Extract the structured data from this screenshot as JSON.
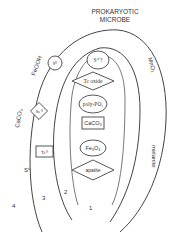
{
  "title_line1": "PROKARYOTIC",
  "title_line2": "MICROBE",
  "zone_labels": {
    "z1": "1",
    "z2": "2",
    "z3": "3",
    "z4": "4"
  },
  "outer_labels": {
    "feooh": "FeOOH",
    "caco3": "CaCO₃",
    "s0_outer": "S⁰",
    "mno2": "MnO₂",
    "melanite": "melanite"
  },
  "zone2_shapes": {
    "s0_circle": "S⁰",
    "se0_diamond": "Se⁰",
    "te0_box": "Te⁰"
  },
  "inner_shapes": {
    "s0_top": "S⁰ ?",
    "tc_oxide": "Tc oxide",
    "poly_po4": "poly-PO₄",
    "caco3_box": "CaCO₃",
    "fe3o4": "Fe₃O₄",
    "apatite": "apatite"
  }
}
